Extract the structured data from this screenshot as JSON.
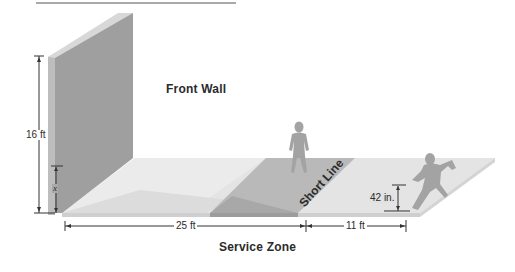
{
  "header": {
    "title_cropped": "",
    "underline": true
  },
  "labels": {
    "front_wall": "Front Wall",
    "short_line": "Short Line",
    "service_zone": "Service Zone",
    "wall_height": "16 ft",
    "x_var": "x",
    "court_length": "25 ft",
    "back_length": "11 ft",
    "player_height": "42 in."
  },
  "icons": {
    "standing_player": "standing-player-silhouette",
    "running_player": "running-player-silhouette"
  },
  "colors": {
    "wall_face": "#9e9e9e",
    "wall_side": "#bdbdbd",
    "wall_top": "#d6d6d6",
    "floor": "#e4e4e4",
    "floor_edge": "#cfcfcf",
    "light_wedge": "#ececec",
    "service_band": "#b8b8b8",
    "service_band_front": "#a6a6a6",
    "silhouette": "#a3a3a3",
    "text": "#2b2b2b",
    "dim_line": "#333333"
  }
}
